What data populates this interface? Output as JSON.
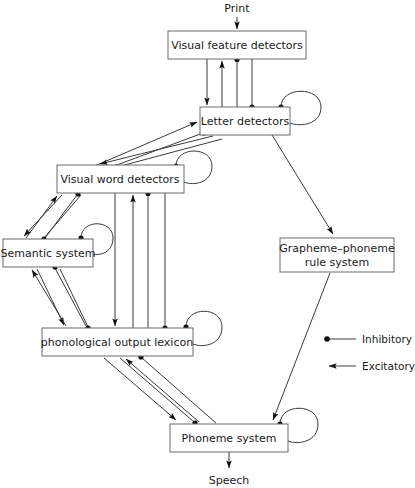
{
  "diagram": {
    "title_free_labels": {
      "input": "Print",
      "output": "Speech"
    },
    "nodes": [
      {
        "id": "visual-feature-detectors",
        "label": "Visual feature detectors",
        "x": 168,
        "y": 31,
        "w": 138,
        "h": 28,
        "self_loop": false
      },
      {
        "id": "letter-detectors",
        "label": "Letter detectors",
        "x": 200,
        "y": 107,
        "w": 90,
        "h": 28,
        "self_loop": true
      },
      {
        "id": "visual-word-detectors",
        "label": "Visual word detectors",
        "x": 57,
        "y": 165,
        "w": 127,
        "h": 28,
        "self_loop": true
      },
      {
        "id": "semantic-system",
        "label": "Semantic system",
        "x": 3,
        "y": 239,
        "w": 90,
        "h": 28,
        "self_loop": true
      },
      {
        "id": "grapheme-phoneme-rule-system",
        "label_line1": "Grapheme–phoneme",
        "label_line2": "rule system",
        "x": 280,
        "y": 238,
        "w": 114,
        "h": 34,
        "self_loop": false
      },
      {
        "id": "phonological-output-lexicon",
        "label": "phonological output lexicon",
        "x": 42,
        "y": 328,
        "w": 151,
        "h": 28,
        "self_loop": true
      },
      {
        "id": "phoneme-system",
        "label": "Phoneme system",
        "x": 170,
        "y": 424,
        "w": 118,
        "h": 28,
        "self_loop": true
      }
    ],
    "legend": [
      {
        "id": "legend-inhibitory",
        "label": "Inhibitory",
        "marker": "dot"
      },
      {
        "id": "legend-excitatory",
        "label": "Excitatory",
        "marker": "arrow"
      }
    ]
  }
}
